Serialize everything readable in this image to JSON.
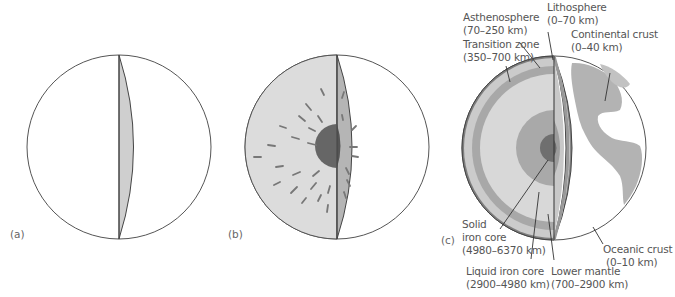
{
  "figure": {
    "panels": [
      {
        "id": "a",
        "label": "(a)"
      },
      {
        "id": "b",
        "label": "(b)"
      },
      {
        "id": "c",
        "label": "(c)"
      }
    ],
    "layers": [
      {
        "name": "Lithosphere",
        "range": "(0–70 km)"
      },
      {
        "name": "Asthenosphere",
        "range": "(70–250 km)"
      },
      {
        "name": "Transition zone",
        "range": "(350–700 km)"
      },
      {
        "name": "Continental crust",
        "range": "(0–40 km)"
      },
      {
        "name_line1": "Solid",
        "name_line2": "iron core",
        "range": "(4980–6370 km)"
      },
      {
        "name": "Liquid iron core",
        "range": "(2900–4980 km)"
      },
      {
        "name": "Lower mantle",
        "range": "(700–2900 km)"
      },
      {
        "name": "Oceanic crust",
        "range": "(0–10 km)"
      }
    ],
    "colors": {
      "outline": "#444444",
      "light_gray": "#d9d9d9",
      "mid_gray": "#bdbdbd",
      "dark_gray": "#9a9a9a",
      "core_dark": "#6b6b6b",
      "land": "#b3b3b3"
    }
  }
}
